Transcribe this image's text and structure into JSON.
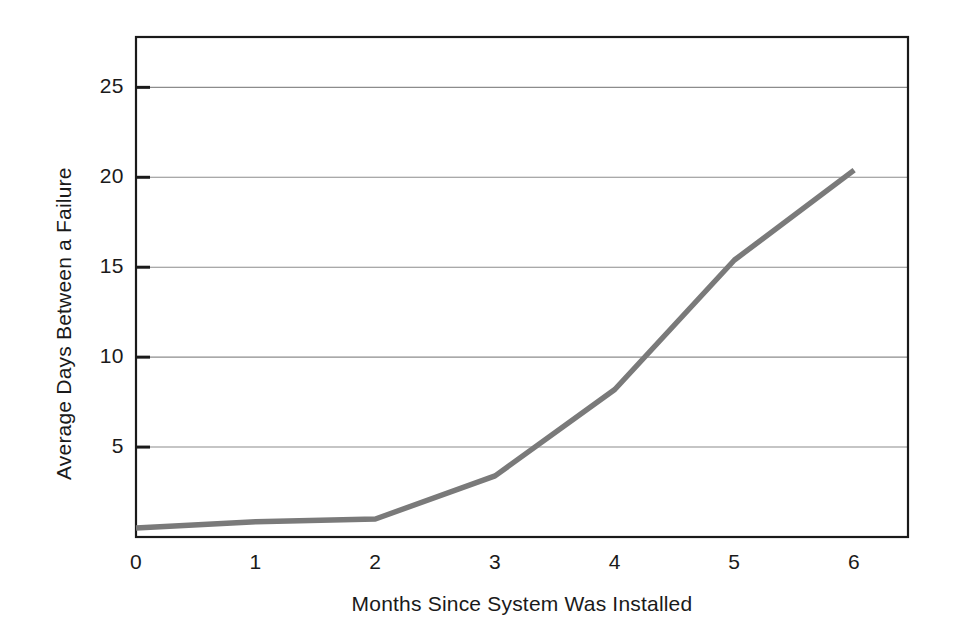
{
  "chart_data": {
    "type": "line",
    "title": "",
    "xlabel": "Months Since System Was Installed",
    "ylabel": "Average Days Between a Failure",
    "x": [
      0,
      1,
      2,
      3,
      4,
      5,
      6
    ],
    "values": [
      0.5,
      0.85,
      1.0,
      3.4,
      8.2,
      15.4,
      20.4
    ],
    "series": [
      {
        "name": "Average Days Between a Failure",
        "values": [
          0.5,
          0.85,
          1.0,
          3.4,
          8.2,
          15.4,
          20.4
        ],
        "color": "#7a7a7a"
      }
    ],
    "xtick_labels": [
      "0",
      "1",
      "2",
      "3",
      "4",
      "5",
      "6"
    ],
    "ytick_labels": [
      "5",
      "10",
      "15",
      "20",
      "25"
    ],
    "ytick_values": [
      5,
      10,
      15,
      20,
      25
    ],
    "xlim": [
      0,
      6.45
    ],
    "ylim": [
      0,
      27.8
    ],
    "grid": "horizontal",
    "legend": "none",
    "line_color": "#7a7a7a",
    "frame_color": "#1a1a1a",
    "grid_color": "#8c8c8c",
    "background_color": "#ffffff"
  }
}
